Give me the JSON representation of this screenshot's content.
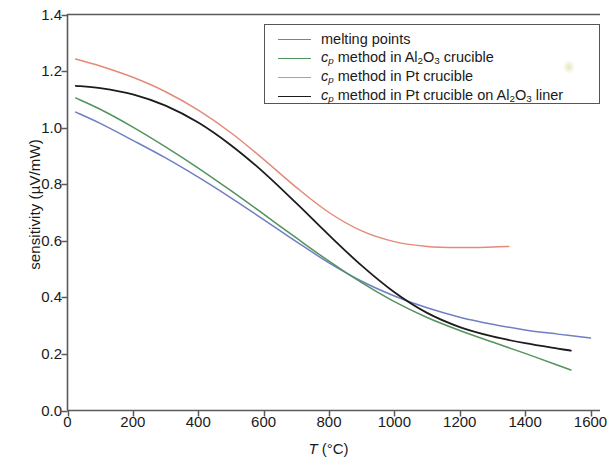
{
  "chart_data": {
    "type": "line",
    "title": "",
    "xlabel": "T (°C)",
    "ylabel": "sensitivity (µV/mW)",
    "xlim": [
      0,
      1660
    ],
    "ylim": [
      0.0,
      1.4
    ],
    "grid": false,
    "legend_position": "top-right",
    "xticks": [
      0,
      200,
      400,
      600,
      800,
      1000,
      1200,
      1400,
      1600
    ],
    "xtick_labels": [
      "0",
      "200",
      "400",
      "600",
      "800",
      "1000",
      "1200",
      "1400",
      "1600"
    ],
    "yticks": [
      0.0,
      0.2,
      0.4,
      0.6,
      0.8,
      1.0,
      1.2,
      1.4
    ],
    "ytick_labels": [
      "0.0",
      "0.2",
      "0.4",
      "0.6",
      "0.8",
      "1.0",
      "1.2",
      "1.4"
    ],
    "series": [
      {
        "name": "melting points",
        "color": "#6f7fc2",
        "x": [
          25,
          100,
          200,
          300,
          400,
          500,
          600,
          700,
          800,
          900,
          1000,
          1100,
          1200,
          1300,
          1400,
          1500,
          1600
        ],
        "y": [
          1.055,
          1.015,
          0.955,
          0.893,
          0.825,
          0.752,
          0.675,
          0.597,
          0.522,
          0.457,
          0.405,
          0.363,
          0.33,
          0.305,
          0.285,
          0.27,
          0.256
        ]
      },
      {
        "name": "cp method in Al2O3 crucible",
        "color": "#52935f",
        "x": [
          25,
          100,
          200,
          300,
          400,
          500,
          600,
          700,
          800,
          900,
          1000,
          1100,
          1200,
          1300,
          1400,
          1500,
          1540
        ],
        "y": [
          1.105,
          1.065,
          1.002,
          0.932,
          0.857,
          0.777,
          0.694,
          0.61,
          0.528,
          0.452,
          0.385,
          0.329,
          0.283,
          0.242,
          0.202,
          0.16,
          0.143
        ]
      },
      {
        "name": "cp method in Pt crucible",
        "color": "#e48a78",
        "x": [
          25,
          100,
          200,
          300,
          400,
          500,
          600,
          700,
          800,
          900,
          1000,
          1100,
          1200,
          1300,
          1350
        ],
        "y": [
          1.243,
          1.218,
          1.178,
          1.127,
          1.062,
          0.982,
          0.888,
          0.789,
          0.7,
          0.635,
          0.597,
          0.58,
          0.576,
          0.578,
          0.58
        ]
      },
      {
        "name": "cp method in Pt crucible on Al2O3 liner",
        "color": "#1c1c1c",
        "x": [
          25,
          100,
          200,
          300,
          400,
          500,
          600,
          700,
          800,
          900,
          1000,
          1100,
          1200,
          1300,
          1400,
          1500,
          1540
        ],
        "y": [
          1.148,
          1.14,
          1.118,
          1.078,
          1.018,
          0.938,
          0.842,
          0.733,
          0.62,
          0.512,
          0.418,
          0.345,
          0.295,
          0.262,
          0.238,
          0.219,
          0.212
        ]
      }
    ]
  },
  "axes": {
    "y_title_prefix": "sensitivity (",
    "y_title_unit": "µV/mW",
    "y_title_suffix": ")",
    "x_title_symbol": "T",
    "x_title_unit": "(°C)"
  },
  "legend": {
    "entries": [
      {
        "color": "#6f7fc2",
        "parts": [
          {
            "text": "melting points",
            "style": "plain"
          }
        ]
      },
      {
        "color": "#52935f",
        "parts": [
          {
            "text": "c",
            "style": "italic"
          },
          {
            "text": "p",
            "style": "italic-sub"
          },
          {
            "text": " method in Al",
            "style": "plain"
          },
          {
            "text": "2",
            "style": "sub"
          },
          {
            "text": "O",
            "style": "plain"
          },
          {
            "text": "3",
            "style": "sub"
          },
          {
            "text": " crucible",
            "style": "plain"
          }
        ]
      },
      {
        "color": "#e48a78",
        "parts": [
          {
            "text": "c",
            "style": "italic"
          },
          {
            "text": "p",
            "style": "italic-sub"
          },
          {
            "text": " method in Pt crucible",
            "style": "plain"
          }
        ]
      },
      {
        "color": "#1c1c1c",
        "parts": [
          {
            "text": "c",
            "style": "italic"
          },
          {
            "text": "p",
            "style": "italic-sub"
          },
          {
            "text": " method in Pt crucible on  Al",
            "style": "plain"
          },
          {
            "text": "2",
            "style": "sub"
          },
          {
            "text": "O",
            "style": "plain"
          },
          {
            "text": "3",
            "style": "sub"
          },
          {
            "text": " liner",
            "style": "plain"
          }
        ]
      }
    ]
  }
}
